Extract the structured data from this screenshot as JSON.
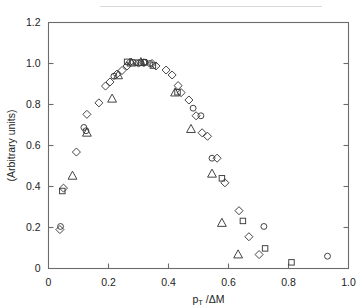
{
  "figure": {
    "kind": "scatter-plot",
    "background_color": "#ffffff",
    "frame_color": "#6b6b6b",
    "marker_color": "#3a3a3a"
  },
  "chart_data": {
    "type": "scatter",
    "title": "",
    "subtitle": "",
    "xlabel": "p_T / ΔM",
    "xlabel_parts": {
      "main": "p",
      "subscript": "T",
      "tail": "/ΔM"
    },
    "ylabel": "(Arbitrary units)",
    "xlim": [
      0,
      1.0
    ],
    "ylim": [
      0,
      1.2
    ],
    "xticks": [
      0,
      0.2,
      0.4,
      0.6,
      0.8,
      1.0
    ],
    "xtick_labels": [
      "0",
      "0.2",
      "0.4",
      "0.6",
      "0.8",
      "1.0"
    ],
    "yticks": [
      0,
      0.2,
      0.4,
      0.6,
      0.8,
      1.0,
      1.2
    ],
    "ytick_labels": [
      "0",
      "0.2",
      "0.4",
      "0.6",
      "0.8",
      "1.0",
      "1.2"
    ],
    "grid": false,
    "legend": "none",
    "legend_position": "none",
    "ticks_direction": "in",
    "ticks_sides": [
      "left",
      "right",
      "bottom"
    ],
    "series": [
      {
        "name": "diamonds",
        "marker": "diamond",
        "points": [
          [
            0.038,
            0.19
          ],
          [
            0.05,
            0.392
          ],
          [
            0.093,
            0.568
          ],
          [
            0.128,
            0.752
          ],
          [
            0.168,
            0.808
          ],
          [
            0.19,
            0.89
          ],
          [
            0.205,
            0.91
          ],
          [
            0.228,
            0.948
          ],
          [
            0.245,
            0.966
          ],
          [
            0.262,
            0.988
          ],
          [
            0.272,
            1.006
          ],
          [
            0.3,
            1.002
          ],
          [
            0.318,
            1.004
          ],
          [
            0.345,
            1.0
          ],
          [
            0.358,
            0.988
          ],
          [
            0.392,
            0.968
          ],
          [
            0.412,
            0.944
          ],
          [
            0.432,
            0.892
          ],
          [
            0.442,
            0.858
          ],
          [
            0.468,
            0.822
          ],
          [
            0.492,
            0.745
          ],
          [
            0.512,
            0.662
          ],
          [
            0.53,
            0.645
          ],
          [
            0.562,
            0.538
          ],
          [
            0.588,
            0.418
          ],
          [
            0.635,
            0.282
          ],
          [
            0.668,
            0.155
          ],
          [
            0.702,
            0.068
          ]
        ]
      },
      {
        "name": "circles",
        "marker": "circle",
        "points": [
          [
            0.04,
            0.205
          ],
          [
            0.118,
            0.688
          ],
          [
            0.125,
            0.672
          ],
          [
            0.218,
            0.938
          ],
          [
            0.282,
            1.006
          ],
          [
            0.292,
            1.004
          ],
          [
            0.308,
            1.004
          ],
          [
            0.322,
            1.006
          ],
          [
            0.338,
            1.0
          ],
          [
            0.482,
            0.782
          ],
          [
            0.508,
            0.745
          ],
          [
            0.545,
            0.538
          ],
          [
            0.718,
            0.205
          ],
          [
            0.93,
            0.06
          ]
        ]
      },
      {
        "name": "squares",
        "marker": "square",
        "points": [
          [
            0.046,
            0.378
          ],
          [
            0.262,
            1.008
          ],
          [
            0.318,
            1.006
          ],
          [
            0.348,
            0.99
          ],
          [
            0.43,
            0.86
          ],
          [
            0.578,
            0.44
          ],
          [
            0.648,
            0.232
          ],
          [
            0.722,
            0.098
          ],
          [
            0.81,
            0.03
          ]
        ]
      },
      {
        "name": "triangles",
        "marker": "triangle",
        "points": [
          [
            0.08,
            0.452
          ],
          [
            0.128,
            0.662
          ],
          [
            0.212,
            0.828
          ],
          [
            0.232,
            0.942
          ],
          [
            0.276,
            1.004
          ],
          [
            0.308,
            1.006
          ],
          [
            0.422,
            0.858
          ],
          [
            0.475,
            0.68
          ],
          [
            0.545,
            0.462
          ],
          [
            0.578,
            0.222
          ],
          [
            0.632,
            0.068
          ]
        ]
      }
    ]
  }
}
